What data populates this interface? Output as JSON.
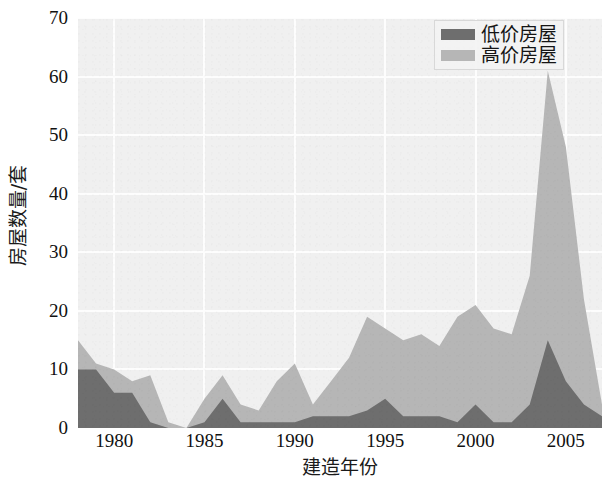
{
  "chart_data": {
    "type": "area",
    "stacked": true,
    "title": "",
    "subtitle": "",
    "xlabel": "建造年份",
    "ylabel": "房屋数量/套",
    "xlim": [
      1978,
      2007
    ],
    "ylim": [
      0,
      70
    ],
    "xticks": [
      1980,
      1985,
      1990,
      1995,
      2000,
      2005
    ],
    "xtick_labels": [
      "1980",
      "1985",
      "1990",
      "1995",
      "2000",
      "2005"
    ],
    "yticks": [
      0,
      10,
      20,
      30,
      40,
      50,
      60,
      70
    ],
    "ytick_labels": [
      "0",
      "10",
      "20",
      "30",
      "40",
      "50",
      "60",
      "70"
    ],
    "grid": true,
    "legend_position": "top-right",
    "x": [
      1978,
      1979,
      1980,
      1981,
      1982,
      1983,
      1984,
      1985,
      1986,
      1987,
      1988,
      1989,
      1990,
      1991,
      1992,
      1993,
      1994,
      1995,
      1996,
      1997,
      1998,
      1999,
      2000,
      2001,
      2002,
      2003,
      2004,
      2005,
      2006,
      2007
    ],
    "series": [
      {
        "name": "低价房屋",
        "color": "#6e6e6e",
        "values": [
          10,
          10,
          6,
          6,
          1,
          0,
          0,
          1,
          5,
          1,
          1,
          1,
          1,
          2,
          2,
          2,
          3,
          5,
          2,
          2,
          2,
          1,
          4,
          1,
          1,
          4,
          15,
          8,
          4,
          2
        ]
      },
      {
        "name": "高价房屋",
        "color": "#b6b6b6",
        "values": [
          5,
          1,
          4,
          2,
          8,
          1,
          0,
          4,
          4,
          3,
          2,
          7,
          10,
          2,
          6,
          10,
          16,
          12,
          13,
          14,
          12,
          18,
          17,
          16,
          15,
          22,
          46,
          40,
          18,
          2
        ]
      }
    ]
  },
  "legend": {
    "entries": [
      {
        "label": "低价房屋",
        "color": "#6e6e6e"
      },
      {
        "label": "高价房屋",
        "color": "#b6b6b6"
      }
    ]
  },
  "colors": {
    "low_price": "#6e6e6e",
    "high_price": "#b6b6b6",
    "plot_background": "#f0f0f0",
    "gridline": "#fdfdfd",
    "text": "#111111"
  }
}
